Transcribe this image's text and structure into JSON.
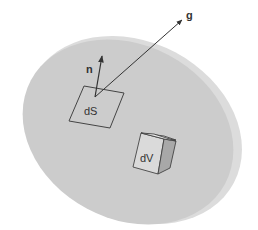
{
  "figure": {
    "colors": {
      "body_face": "#cfcfcf",
      "body_rim": "#dedede",
      "body_rim_shadow": "#c2c2c2",
      "stroke": "#444444",
      "cube_top": "#e6e6e6",
      "cube_front": "#d9d9d9",
      "cube_side": "#a9a9a9"
    },
    "labels": {
      "normal": "n",
      "vector": "g",
      "surface_element": "dS",
      "volume_element": "dV"
    }
  }
}
